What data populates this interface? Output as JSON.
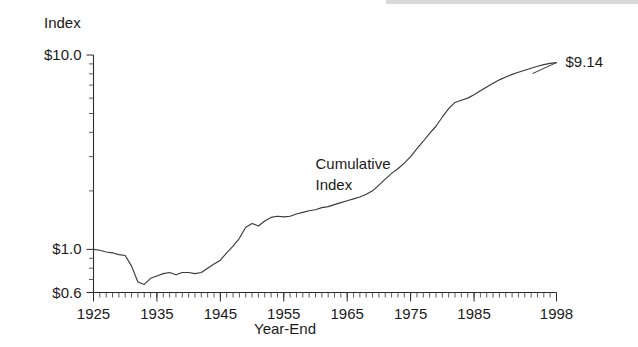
{
  "chart_data": {
    "type": "line",
    "title": "",
    "ylabel": "Index",
    "xlabel": "Year-End",
    "yscale": "log",
    "ylim": [
      0.6,
      10.0
    ],
    "xlim": [
      1925,
      1998
    ],
    "grid": false,
    "legend": "none",
    "y_tick_labels": [
      "$10.0",
      "$1.0",
      "$0.6"
    ],
    "y_tick_values": [
      10.0,
      1.0,
      0.6
    ],
    "x_tick_labels": [
      "1925",
      "1935",
      "1945",
      "1955",
      "1965",
      "1975",
      "1985",
      "1998"
    ],
    "x_tick_values": [
      1925,
      1935,
      1945,
      1955,
      1965,
      1975,
      1985,
      1998
    ],
    "x_minor_tick_interval": 1,
    "annotations": [
      {
        "text_line1": "Cumulative",
        "text_line2": "Index",
        "x": 1960,
        "y": 2.6
      },
      {
        "text": "$9.14",
        "x": 1998,
        "y": 9.14,
        "leader": true
      }
    ],
    "series": [
      {
        "name": "Cumulative Index",
        "color": "#3a3a3a",
        "x": [
          1925,
          1926,
          1927,
          1928,
          1929,
          1930,
          1931,
          1932,
          1933,
          1934,
          1935,
          1936,
          1937,
          1938,
          1939,
          1940,
          1941,
          1942,
          1943,
          1944,
          1945,
          1946,
          1947,
          1948,
          1949,
          1950,
          1951,
          1952,
          1953,
          1954,
          1955,
          1956,
          1957,
          1958,
          1959,
          1960,
          1961,
          1962,
          1963,
          1964,
          1965,
          1966,
          1967,
          1968,
          1969,
          1970,
          1971,
          1972,
          1973,
          1974,
          1975,
          1976,
          1977,
          1978,
          1979,
          1980,
          1981,
          1982,
          1983,
          1984,
          1985,
          1986,
          1987,
          1988,
          1989,
          1990,
          1991,
          1992,
          1993,
          1994,
          1995,
          1996,
          1997,
          1998
        ],
        "y": [
          1.0,
          0.99,
          0.97,
          0.96,
          0.94,
          0.93,
          0.82,
          0.68,
          0.66,
          0.71,
          0.73,
          0.75,
          0.76,
          0.74,
          0.76,
          0.76,
          0.75,
          0.76,
          0.8,
          0.84,
          0.88,
          0.96,
          1.04,
          1.14,
          1.3,
          1.36,
          1.32,
          1.4,
          1.46,
          1.48,
          1.47,
          1.48,
          1.52,
          1.55,
          1.58,
          1.6,
          1.64,
          1.66,
          1.7,
          1.74,
          1.78,
          1.82,
          1.86,
          1.92,
          2.0,
          2.14,
          2.3,
          2.46,
          2.6,
          2.78,
          3.0,
          3.3,
          3.6,
          3.95,
          4.3,
          4.8,
          5.3,
          5.7,
          5.85,
          6.0,
          6.25,
          6.55,
          6.85,
          7.15,
          7.45,
          7.7,
          7.95,
          8.15,
          8.35,
          8.55,
          8.75,
          8.92,
          9.05,
          9.14
        ]
      }
    ]
  },
  "labels": {
    "y_axis_title": "Index",
    "x_axis_title": "Year-End",
    "annotation_line1": "Cumulative",
    "annotation_line2": "Index",
    "end_value": "$9.14"
  },
  "colors": {
    "line": "#3a3a3a",
    "axis": "#2b2b2b",
    "text": "#1a1a1a",
    "background": "#ffffff"
  }
}
